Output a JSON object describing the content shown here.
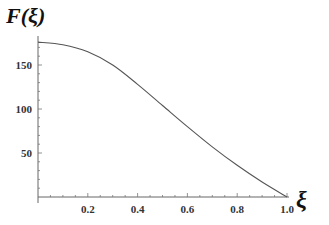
{
  "chart_data": {
    "type": "line",
    "title": "",
    "xlabel": "ξ",
    "ylabel": "F(ξ)",
    "xlim": [
      0,
      1.0
    ],
    "ylim": [
      0,
      180
    ],
    "grid": false,
    "legend": null,
    "x_ticks": [
      0.2,
      0.4,
      0.6,
      0.8,
      1.0
    ],
    "x_tick_labels": [
      "0.2",
      "0.4",
      "0.6",
      "0.8",
      "1.0"
    ],
    "y_ticks": [
      50,
      100,
      150
    ],
    "y_tick_labels": [
      "50",
      "100",
      "150"
    ],
    "series": [
      {
        "name": "F(ξ)",
        "color": "#555555",
        "x": [
          0.0,
          0.1,
          0.2,
          0.3,
          0.4,
          0.5,
          0.6,
          0.7,
          0.8,
          0.9,
          1.0
        ],
        "values": [
          176,
          173,
          165,
          150,
          128,
          104,
          80,
          57,
          36,
          17,
          0
        ]
      }
    ]
  },
  "labels": {
    "y_axis_title": "F(ξ)",
    "x_axis_title": "ξ"
  }
}
